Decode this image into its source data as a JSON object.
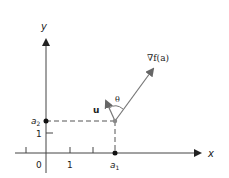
{
  "diagram": {
    "axes": {
      "x_label": "x",
      "y_label": "y"
    },
    "tick_labels": {
      "origin": "0",
      "x_one": "1",
      "y_one": "1",
      "a1_main": "a",
      "a1_sub": "1",
      "a2_main": "a",
      "a2_sub": "2"
    },
    "vectors": {
      "gradient_label": "∇f(a)",
      "u_label": "u",
      "angle_label": "θ"
    },
    "colors": {
      "axis": "#333333",
      "vector": "#777777",
      "point": "#111111",
      "base_point": "#888888"
    }
  }
}
